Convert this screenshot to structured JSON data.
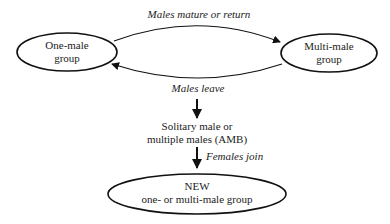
{
  "diagram": {
    "nodes": {
      "one_male": {
        "line1": "One-male",
        "line2": "group"
      },
      "multi_male": {
        "line1": "Multi-male",
        "line2": "group"
      },
      "solitary": {
        "line1": "Solitary male or",
        "line2": "multiple males (AMB)"
      },
      "new_group": {
        "line1": "NEW",
        "line2": "one- or multi-male group"
      }
    },
    "edges": {
      "mature": {
        "label": "Males mature or return"
      },
      "leave": {
        "label": "Males leave"
      },
      "join": {
        "label": "Females join"
      }
    },
    "colors": {
      "stroke": "#111111",
      "text": "#222222",
      "background": "#ffffff"
    }
  }
}
